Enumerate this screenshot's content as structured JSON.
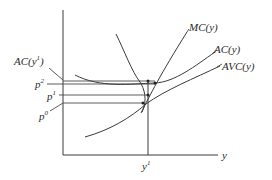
{
  "diagram": {
    "type": "cost-curves",
    "axes": {
      "x_label": "y",
      "x_tick": "y",
      "x_tick_sup": "1"
    },
    "curves": [
      {
        "id": "mc",
        "label": "MC(y)"
      },
      {
        "id": "ac",
        "label": "AC(y)"
      },
      {
        "id": "avc",
        "label": "AVC(y)"
      }
    ],
    "price_labels": [
      {
        "id": "ac_y1",
        "base": "AC(y",
        "sup": "1",
        "close": ")"
      },
      {
        "id": "p2",
        "base": "p",
        "sup": "2"
      },
      {
        "id": "p1",
        "base": "p",
        "sup": "1"
      },
      {
        "id": "p0",
        "base": "p",
        "sup": "0"
      }
    ],
    "colors": {
      "line": "#3a3a3a",
      "text": "#2a2a2a",
      "background": "#ffffff"
    }
  }
}
